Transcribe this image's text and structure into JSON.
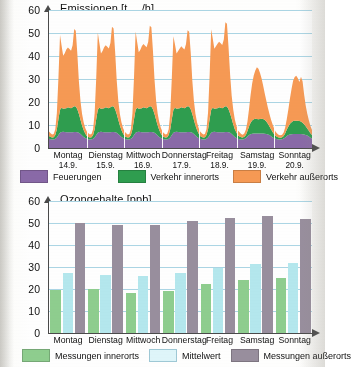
{
  "figure": {
    "language": "de",
    "colors": {
      "feuerungen": "#8a6aa8",
      "verkehr_innerorts": "#2f9e4f",
      "verkehr_ausserorts": "#f79a54",
      "messungen_innerorts": "#8fce8f",
      "mittelwert": "#b5e8ee",
      "messungen_ausserorts": "#998f9e",
      "gridline": "#9ecfe0",
      "axis": "#4a4a4a"
    }
  },
  "chart_data": [
    {
      "type": "area",
      "stacked": true,
      "title": "Emissionen [tNOx/h]",
      "title_main": "Emissionen [t",
      "title_sub": "NOx",
      "title_tail": "/h]",
      "xlabel": "",
      "ylabel": "Emissionen",
      "yunit": "t NOx/h",
      "ylim": [
        0,
        60
      ],
      "yticks": [
        0,
        10,
        20,
        30,
        40,
        50,
        60
      ],
      "grid": true,
      "legend_position": "bottom",
      "categories": [
        "Montag",
        "Dienstag",
        "Mittwoch",
        "Donnerstag",
        "Freitag",
        "Samstag",
        "Sonntag"
      ],
      "category_dates": [
        "14.9.",
        "15.9.",
        "16.9.",
        "17.9.",
        "18.9.",
        "19.9.",
        "20.9."
      ],
      "x_resolution": "hourly",
      "series": [
        {
          "name": "Feuerungen",
          "color": "#8a6aa8",
          "values": [
            4.0,
            3.8,
            3.7,
            3.7,
            4.0,
            4.6,
            5.6,
            6.6,
            7.0,
            7.1,
            7.0,
            6.9,
            6.9,
            6.9,
            6.9,
            6.9,
            7.0,
            7.0,
            6.9,
            6.6,
            6.1,
            5.4,
            4.8,
            4.3,
            4.0,
            3.8,
            3.7,
            3.7,
            4.0,
            4.6,
            5.6,
            6.6,
            7.0,
            7.1,
            7.0,
            6.9,
            6.9,
            6.9,
            6.9,
            6.9,
            7.0,
            7.0,
            6.9,
            6.6,
            6.1,
            5.4,
            4.8,
            4.3,
            4.0,
            3.8,
            3.7,
            3.7,
            4.0,
            4.6,
            5.6,
            6.6,
            7.0,
            7.1,
            7.0,
            6.9,
            6.9,
            6.9,
            6.9,
            6.9,
            7.0,
            7.0,
            6.9,
            6.6,
            6.1,
            5.4,
            4.8,
            4.3,
            4.0,
            3.8,
            3.7,
            3.7,
            4.0,
            4.6,
            5.6,
            6.6,
            7.0,
            7.1,
            7.0,
            6.9,
            6.9,
            6.9,
            6.9,
            6.9,
            7.0,
            7.0,
            6.9,
            6.6,
            6.1,
            5.4,
            4.8,
            4.3,
            4.0,
            3.8,
            3.7,
            3.7,
            4.0,
            4.6,
            5.6,
            6.6,
            7.0,
            7.1,
            7.0,
            6.9,
            6.9,
            6.9,
            6.9,
            6.9,
            7.0,
            7.0,
            6.9,
            6.6,
            6.1,
            5.4,
            4.8,
            4.3,
            4.0,
            3.8,
            3.7,
            3.7,
            3.9,
            4.3,
            5.0,
            5.6,
            6.0,
            6.2,
            6.3,
            6.3,
            6.3,
            6.3,
            6.3,
            6.3,
            6.3,
            6.2,
            6.1,
            5.9,
            5.6,
            5.1,
            4.6,
            4.2,
            4.0,
            3.8,
            3.7,
            3.7,
            3.8,
            4.1,
            4.6,
            5.2,
            5.6,
            5.9,
            6.0,
            6.1,
            6.1,
            6.1,
            6.1,
            6.1,
            6.1,
            6.0,
            5.9,
            5.7,
            5.4,
            5.0,
            4.5,
            4.1
          ]
        },
        {
          "name": "Verkehr innerorts",
          "color": "#2f9e4f",
          "values": [
            1.2,
            1.0,
            0.9,
            1.0,
            1.6,
            3.6,
            7.0,
            10.0,
            10.5,
            10.0,
            10.2,
            10.4,
            10.8,
            10.6,
            10.4,
            10.8,
            11.2,
            11.0,
            10.0,
            8.2,
            6.2,
            4.4,
            3.0,
            2.0,
            1.2,
            1.0,
            0.9,
            1.0,
            1.6,
            3.6,
            7.0,
            10.0,
            10.5,
            10.0,
            10.2,
            10.4,
            10.8,
            10.6,
            10.4,
            10.8,
            11.2,
            11.0,
            10.0,
            8.2,
            6.2,
            4.4,
            3.0,
            2.0,
            1.2,
            1.0,
            0.9,
            1.0,
            1.6,
            3.6,
            7.0,
            10.0,
            10.5,
            10.0,
            10.2,
            10.4,
            10.8,
            10.6,
            10.4,
            10.8,
            11.2,
            11.0,
            10.0,
            8.2,
            6.2,
            4.4,
            3.0,
            2.0,
            1.2,
            1.0,
            0.9,
            1.0,
            1.6,
            3.6,
            7.0,
            10.0,
            10.5,
            10.0,
            10.2,
            10.4,
            10.8,
            10.6,
            10.4,
            10.8,
            11.2,
            11.0,
            10.0,
            8.2,
            6.2,
            4.4,
            3.0,
            2.0,
            1.2,
            1.0,
            0.9,
            1.0,
            1.6,
            3.6,
            7.0,
            10.0,
            10.5,
            10.0,
            10.2,
            10.4,
            10.8,
            10.6,
            10.4,
            10.8,
            11.2,
            11.0,
            10.0,
            8.4,
            6.6,
            4.8,
            3.4,
            2.4,
            1.4,
            1.2,
            1.0,
            0.9,
            1.0,
            1.4,
            2.4,
            3.8,
            5.0,
            5.8,
            6.2,
            6.4,
            6.3,
            6.2,
            6.3,
            6.4,
            6.3,
            6.0,
            5.4,
            4.6,
            3.8,
            3.0,
            2.4,
            1.8,
            1.2,
            1.0,
            0.9,
            0.8,
            0.9,
            1.1,
            1.8,
            2.8,
            3.8,
            4.6,
            5.2,
            5.6,
            5.8,
            5.8,
            5.7,
            5.6,
            5.4,
            5.0,
            4.4,
            3.8,
            3.1,
            2.5,
            1.9,
            1.5
          ]
        },
        {
          "name": "Verkehr außerorts",
          "color": "#f79a54",
          "values": [
            2.0,
            1.6,
            1.3,
            1.4,
            2.6,
            7.0,
            18.0,
            32.5,
            27.0,
            23.0,
            24.0,
            25.5,
            26.0,
            25.5,
            25.0,
            27.0,
            33.5,
            33.0,
            24.0,
            14.0,
            8.0,
            5.0,
            3.4,
            2.4,
            2.0,
            1.6,
            1.3,
            1.4,
            2.6,
            7.0,
            18.0,
            33.5,
            28.0,
            24.0,
            25.0,
            26.5,
            27.0,
            26.5,
            26.0,
            28.0,
            34.5,
            34.0,
            25.0,
            14.5,
            8.2,
            5.0,
            3.4,
            2.4,
            2.0,
            1.6,
            1.3,
            1.4,
            2.6,
            7.0,
            18.5,
            34.0,
            28.5,
            24.5,
            25.5,
            27.0,
            27.5,
            27.0,
            26.5,
            28.5,
            35.0,
            34.5,
            25.5,
            15.0,
            8.4,
            5.2,
            3.5,
            2.5,
            2.0,
            1.6,
            1.3,
            1.4,
            2.6,
            7.0,
            18.0,
            32.0,
            27.5,
            24.0,
            25.0,
            26.0,
            26.5,
            26.0,
            25.5,
            27.5,
            33.0,
            32.5,
            24.5,
            14.5,
            8.2,
            5.0,
            3.4,
            2.4,
            2.0,
            1.6,
            1.3,
            1.4,
            2.6,
            7.2,
            19.0,
            35.0,
            30.0,
            26.0,
            27.0,
            28.0,
            28.5,
            28.0,
            27.5,
            29.5,
            36.5,
            36.0,
            27.0,
            17.0,
            10.0,
            6.4,
            4.2,
            3.0,
            2.2,
            1.8,
            1.4,
            1.2,
            1.4,
            2.2,
            4.0,
            7.5,
            12.0,
            16.0,
            19.0,
            21.0,
            22.5,
            22.0,
            20.0,
            17.5,
            14.5,
            11.5,
            9.0,
            7.0,
            5.4,
            4.2,
            3.2,
            2.4,
            1.8,
            1.4,
            1.1,
            1.0,
            1.1,
            1.5,
            2.6,
            4.6,
            7.5,
            11.0,
            14.5,
            17.5,
            19.0,
            19.5,
            18.5,
            17.0,
            19.5,
            18.0,
            13.0,
            9.0,
            6.4,
            4.6,
            3.2,
            2.2
          ]
        }
      ],
      "peaks_note": {
        "weekday_max_total": [
          50,
          52,
          53,
          51,
          54.5
        ],
        "weekend_max_total": [
          35,
          32
        ]
      }
    },
    {
      "type": "bar",
      "title": "Ozongehalte [ppb]",
      "xlabel": "",
      "ylabel": "Ozongehalte",
      "yunit": "ppb",
      "ylim": [
        0,
        60
      ],
      "yticks": [
        0,
        10,
        20,
        30,
        40,
        50,
        60
      ],
      "grid": true,
      "legend_position": "bottom",
      "categories": [
        "Montag",
        "Dienstag",
        "Mittwoch",
        "Donnerstag",
        "Freitag",
        "Samstag",
        "Sonntag"
      ],
      "series": [
        {
          "name": "Messungen innerorts",
          "color": "#8fce8f",
          "values": [
            19.5,
            20.0,
            18.0,
            19.3,
            22.5,
            24.0,
            24.8
          ]
        },
        {
          "name": "Mittelwert",
          "color": "#b5e8ee",
          "values": [
            27.5,
            26.2,
            25.7,
            27.5,
            29.7,
            31.2,
            32.0
          ]
        },
        {
          "name": "Messungen außerorts",
          "color": "#998f9e",
          "values": [
            50.0,
            49.2,
            49.0,
            51.0,
            52.5,
            53.3,
            52.0
          ]
        }
      ]
    }
  ]
}
